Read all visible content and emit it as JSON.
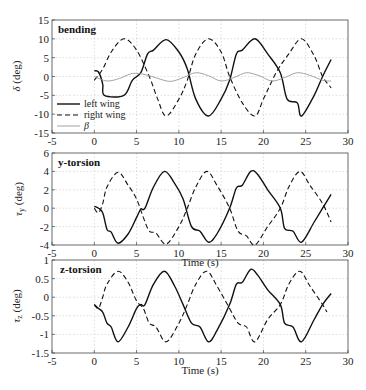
{
  "chart_data": [
    {
      "type": "line",
      "title": "bending",
      "xlabel": "",
      "ylabel": "δ (deg)",
      "xlim": [
        -5,
        30
      ],
      "ylim": [
        -15,
        15
      ],
      "xticks": [
        -5,
        0,
        5,
        10,
        15,
        20,
        25,
        30
      ],
      "yticks": [
        15,
        10,
        5,
        0,
        -5,
        -10,
        -15
      ],
      "grid": true,
      "legend": {
        "position": "lower-left",
        "entries": [
          "left wing",
          "right wing",
          "β"
        ]
      },
      "series": [
        {
          "name": "left wing",
          "style": "solid",
          "x": [
            0,
            0.5,
            1.0,
            1.2,
            3.5,
            4.5,
            5.5,
            6.3,
            7.0,
            8.5,
            10.0,
            11.0,
            12.0,
            13.5,
            15.0,
            16.0,
            16.8,
            17.5,
            19.0,
            20.5,
            22.0,
            22.8,
            24.0,
            24.5,
            26.0,
            27.0,
            28.0
          ],
          "y": [
            1.5,
            1.2,
            -2.0,
            -5.0,
            -5.0,
            -1.0,
            1.0,
            6.0,
            7.0,
            9.8,
            6.5,
            2.0,
            -6.0,
            -10.5,
            -6.0,
            -1.0,
            6.0,
            7.0,
            10.0,
            6.0,
            1.0,
            -6.0,
            -7.0,
            -10.5,
            -5.0,
            0.0,
            4.5
          ]
        },
        {
          "name": "right wing",
          "style": "dashed",
          "x": [
            0,
            1.0,
            2.0,
            3.5,
            5.0,
            6.5,
            7.5,
            8.5,
            10.0,
            11.0,
            12.0,
            13.5,
            15.0,
            16.0,
            17.5,
            19.0,
            20.0,
            21.5,
            23.0,
            24.5,
            26.0,
            27.0,
            28.0
          ],
          "y": [
            -1.0,
            2.0,
            6.5,
            10.0,
            7.0,
            0.0,
            -6.0,
            -10.5,
            -6.0,
            -1.0,
            6.0,
            10.0,
            6.5,
            0.0,
            -7.0,
            -10.5,
            -6.0,
            1.0,
            6.0,
            10.0,
            5.5,
            0.0,
            -3.0
          ]
        },
        {
          "name": "β",
          "style": "solid-gray",
          "x": [
            0,
            1.5,
            3.0,
            4.5,
            6.0,
            7.5,
            9.0,
            10.5,
            12.0,
            13.5,
            15.0,
            16.5,
            18.0,
            19.5,
            21.0,
            22.5,
            24.0,
            25.5,
            27.0,
            28.0
          ],
          "y": [
            0.0,
            -1.2,
            -0.5,
            0.8,
            0.5,
            -0.5,
            -1.3,
            -0.3,
            1.0,
            0.2,
            -1.2,
            -0.3,
            1.0,
            0.2,
            -1.2,
            -0.3,
            1.0,
            0.3,
            -1.0,
            -1.2
          ]
        }
      ]
    },
    {
      "type": "line",
      "title": "y-torsion",
      "xlabel": "Time (s)",
      "ylabel": "τy (deg)",
      "xlim": [
        -5,
        30
      ],
      "ylim": [
        -4,
        6
      ],
      "xticks": [
        -5,
        0,
        5,
        10,
        15,
        20,
        25,
        30
      ],
      "yticks": [
        6,
        4,
        2,
        0,
        -2,
        -4
      ],
      "grid": true,
      "series": [
        {
          "name": "left wing",
          "style": "solid",
          "x": [
            0,
            0.5,
            1.0,
            1.5,
            2.0,
            2.8,
            4.0,
            5.0,
            5.5,
            6.0,
            7.0,
            8.3,
            9.5,
            10.5,
            11.5,
            12.5,
            13.5,
            14.5,
            16.0,
            16.8,
            17.5,
            18.5,
            19.3,
            20.5,
            22.0,
            22.5,
            23.5,
            24.5,
            26.0,
            27.0,
            28.0
          ],
          "y": [
            0.2,
            0.0,
            -0.5,
            -2.3,
            -2.6,
            -3.8,
            -2.8,
            -1.0,
            -0.1,
            0.0,
            2.3,
            4.0,
            2.7,
            1.0,
            -2.0,
            -2.5,
            -3.7,
            -2.8,
            0.0,
            2.2,
            2.5,
            4.0,
            3.7,
            2.0,
            0.0,
            -2.2,
            -2.5,
            -3.7,
            -1.5,
            0.0,
            1.5
          ]
        },
        {
          "name": "right wing",
          "style": "dashed",
          "x": [
            0,
            0.5,
            1.0,
            1.5,
            2.8,
            4.0,
            5.0,
            5.8,
            6.5,
            7.3,
            8.5,
            10.0,
            11.0,
            12.0,
            13.3,
            14.5,
            16.0,
            17.0,
            18.0,
            19.0,
            20.5,
            22.0,
            23.0,
            24.3,
            25.5,
            27.0,
            28.0
          ],
          "y": [
            0.0,
            -0.5,
            0.5,
            2.3,
            3.9,
            2.5,
            1.0,
            -1.0,
            -2.5,
            -2.7,
            -3.9,
            -2.0,
            0.0,
            2.3,
            4.0,
            2.5,
            0.0,
            -2.5,
            -3.0,
            -4.0,
            -2.0,
            0.0,
            2.3,
            4.0,
            2.5,
            0.5,
            -1.5
          ]
        }
      ]
    },
    {
      "type": "line",
      "title": "z-torsion",
      "xlabel": "Time (s)",
      "ylabel": "τz (deg)",
      "xlim": [
        -5,
        30
      ],
      "ylim": [
        -1.5,
        1
      ],
      "xticks": [
        -5,
        0,
        5,
        10,
        15,
        20,
        25,
        30
      ],
      "yticks": [
        1,
        0.5,
        0,
        -0.5,
        -1,
        -1.5
      ],
      "grid": true,
      "series": [
        {
          "name": "left wing",
          "style": "solid",
          "x": [
            0,
            0.5,
            1.0,
            1.5,
            2.0,
            2.8,
            4.0,
            5.0,
            5.5,
            6.0,
            7.0,
            8.3,
            9.5,
            10.5,
            11.5,
            12.5,
            13.5,
            14.5,
            16.0,
            16.8,
            17.5,
            18.5,
            19.3,
            20.5,
            22.0,
            22.5,
            23.5,
            24.5,
            26.0,
            27.0,
            28.0
          ],
          "y": [
            -0.2,
            -0.3,
            -0.4,
            -0.7,
            -0.8,
            -1.2,
            -0.8,
            -0.3,
            -0.2,
            -0.2,
            0.35,
            0.7,
            0.3,
            -0.2,
            -0.7,
            -0.8,
            -1.2,
            -0.9,
            -0.2,
            0.35,
            0.4,
            0.75,
            0.6,
            0.2,
            -0.2,
            -0.7,
            -0.8,
            -1.2,
            -0.6,
            -0.2,
            0.1
          ]
        },
        {
          "name": "right wing",
          "style": "dashed",
          "x": [
            0,
            0.5,
            1.0,
            1.5,
            2.8,
            4.0,
            5.0,
            5.8,
            6.5,
            7.3,
            8.5,
            10.0,
            11.0,
            12.0,
            13.3,
            14.5,
            16.0,
            17.0,
            18.0,
            19.0,
            20.5,
            22.0,
            23.0,
            24.3,
            25.5,
            27.0,
            27.5
          ],
          "y": [
            -0.2,
            -0.3,
            0.0,
            0.35,
            0.7,
            0.4,
            -0.1,
            -0.3,
            -0.7,
            -0.8,
            -1.2,
            -0.7,
            -0.2,
            0.35,
            0.7,
            0.3,
            -0.3,
            -0.7,
            -0.8,
            -1.2,
            -0.6,
            -0.2,
            0.35,
            0.7,
            0.3,
            -0.2,
            -0.4
          ]
        }
      ]
    }
  ],
  "panels": [
    {
      "title": "bending",
      "ylabel_main": "δ",
      "ylabel_unit": " (deg)",
      "yticks": [
        "15",
        "10",
        "5",
        "0",
        "-5",
        "-10",
        "-15"
      ],
      "xticks": [
        "-5",
        "0",
        "5",
        "10",
        "15",
        "20",
        "25",
        "30"
      ]
    },
    {
      "title": "y-torsion",
      "ylabel_main": "τ",
      "ylabel_sub": "y",
      "ylabel_unit": " (deg)",
      "yticks": [
        "6",
        "4",
        "2",
        "0",
        "-2",
        "-4"
      ],
      "xticks": [
        "-5",
        "0",
        "5",
        "10",
        "15",
        "20",
        "25",
        "30"
      ],
      "xlabel": "Time (s)"
    },
    {
      "title": "z-torsion",
      "ylabel_main": "τ",
      "ylabel_sub": "z",
      "ylabel_unit": " (deg)",
      "yticks": [
        "1",
        "0.5",
        "0",
        "-0.5",
        "-1",
        "-1.5"
      ],
      "xticks": [
        "-5",
        "0",
        "5",
        "10",
        "15",
        "20",
        "25",
        "30"
      ],
      "xlabel": "Time (s)"
    }
  ],
  "legend": {
    "left": "left wing",
    "right": "right wing",
    "beta": "β"
  }
}
